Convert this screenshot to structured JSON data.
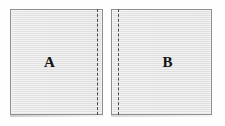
{
  "figure": {
    "type": "two-panel-region-diagram",
    "background_color": "#fefefe",
    "panel_fill_color": "#e3e3e3",
    "panel_border_color": "#8e8e8e",
    "dashed_line_color": "#4a4a4a",
    "label_color": "#141414"
  },
  "panels": [
    {
      "id": "a",
      "label": "A",
      "dashed_line_side": "right",
      "dashed_icon_name": "dashed-vertical-line-icon"
    },
    {
      "id": "b",
      "label": "B",
      "dashed_line_side": "left",
      "dashed_icon_name": "dashed-vertical-line-icon"
    }
  ]
}
